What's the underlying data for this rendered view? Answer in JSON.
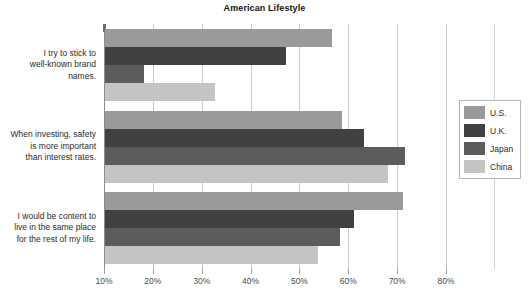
{
  "chart_data": {
    "type": "bar",
    "orientation": "horizontal",
    "title": "American Lifestyle",
    "subtitle": "",
    "xlabel": "",
    "ylabel": "",
    "xlim": [
      10,
      80
    ],
    "xtick_labels": [
      "10%",
      "20%",
      "30%",
      "40%",
      "50%",
      "60%",
      "70%",
      "80%"
    ],
    "xticks": [
      10,
      20,
      30,
      40,
      50,
      60,
      70,
      80
    ],
    "grid": true,
    "legend_position": "right",
    "categories": [
      "I try to stick to well-known brand names.",
      "When investing, safety is more important than interest rates.",
      "I would be content to live in the same place for the rest of my life."
    ],
    "series": [
      {
        "name": "U.S.",
        "color": "#9a9a9a",
        "values": [
          56.5,
          58.5,
          71.0
        ]
      },
      {
        "name": "U.K.",
        "color": "#414141",
        "values": [
          47.0,
          63.0,
          61.0
        ]
      },
      {
        "name": "Japan",
        "color": "#5c5c5c",
        "values": [
          18.0,
          71.5,
          58.0
        ]
      },
      {
        "name": "China",
        "color": "#c4c4c4",
        "values": [
          32.5,
          68.0,
          53.5
        ]
      }
    ]
  },
  "legend": {
    "items": [
      {
        "label": "U.S."
      },
      {
        "label": "U.K."
      },
      {
        "label": "Japan"
      },
      {
        "label": "China"
      }
    ]
  },
  "category_lines": [
    [
      "I try to stick to",
      "well-known brand",
      "names."
    ],
    [
      "When investing, safety",
      "is more important",
      "than interest rates."
    ],
    [
      "I would be content to",
      "live in the same place",
      "for the rest of my life."
    ]
  ]
}
